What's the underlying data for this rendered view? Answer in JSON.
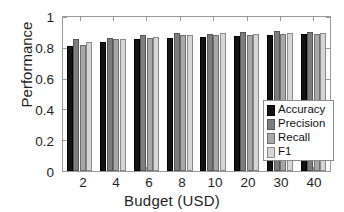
{
  "chart_data": {
    "type": "bar",
    "title": "",
    "xlabel": "Budget (USD)",
    "ylabel": "Performance",
    "categories": [
      "2",
      "4",
      "6",
      "8",
      "10",
      "20",
      "30",
      "40"
    ],
    "series": [
      {
        "name": "Accuracy",
        "color": "#121212",
        "values": [
          0.815,
          0.835,
          0.855,
          0.866,
          0.873,
          0.876,
          0.881,
          0.888
        ]
      },
      {
        "name": "Precision",
        "color": "#7d7d7d",
        "values": [
          0.858,
          0.861,
          0.882,
          0.896,
          0.893,
          0.903,
          0.91,
          0.901
        ]
      },
      {
        "name": "Recall",
        "color": "#a8a8a8",
        "values": [
          0.82,
          0.855,
          0.866,
          0.881,
          0.884,
          0.885,
          0.887,
          0.893
        ]
      },
      {
        "name": "F1",
        "color": "#d6d6d6",
        "values": [
          0.84,
          0.855,
          0.872,
          0.883,
          0.895,
          0.893,
          0.896,
          0.899
        ]
      }
    ],
    "ylim": [
      0,
      1
    ],
    "yticks": [
      "0",
      "0.2",
      "0.4",
      "0.6",
      "0.8",
      "1"
    ],
    "ytick_values": [
      0,
      0.2,
      0.4,
      0.6,
      0.8,
      1
    ],
    "grid": false,
    "legend_position": "lower-right",
    "legend_entries": [
      "Accuracy",
      "Precision",
      "Recall",
      "F1"
    ]
  }
}
